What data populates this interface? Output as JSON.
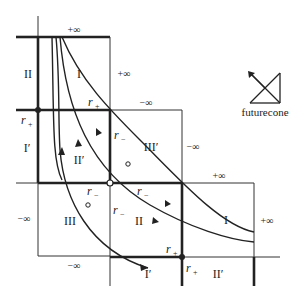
{
  "diagram": {
    "type": "penrose-causal-diagram",
    "regions": {
      "top_left_II": "II",
      "top_I": "I",
      "left_I_prime": "I′",
      "mid_II_prime": "II′",
      "mid_III_prime": "III′",
      "bottom_III": "III",
      "center_II": "II",
      "right_I": "I",
      "bottom_I_prime": "I′",
      "bottom_II_prime": "II′"
    },
    "infinity_labels": {
      "top_plus": "+∞",
      "top_right_plus": "+∞",
      "mid_minus_top": "−∞",
      "mid_minus_right": "−∞",
      "right_box_plus_top": "+∞",
      "right_box_plus_side": "+∞",
      "left_minus": "−∞",
      "bottom_minus": "−∞"
    },
    "horizon_labels": {
      "r_plus": "r",
      "r_plus_sub": "+",
      "r_minus": "r",
      "r_minus_sub": "−"
    },
    "legend": {
      "label": "futurecone"
    }
  }
}
